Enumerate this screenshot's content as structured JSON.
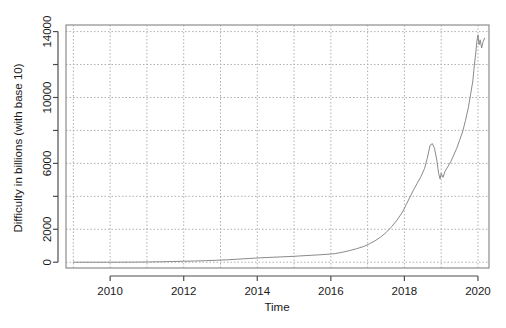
{
  "chart_data": {
    "type": "line",
    "title": "",
    "xlabel": "Time",
    "ylabel": "Difficulty in billions (with base 10)",
    "xlim": [
      2008.8,
      2020.3
    ],
    "ylim": [
      -350,
      14400
    ],
    "xticks": [
      2010,
      2012,
      2014,
      2016,
      2018,
      2020
    ],
    "xtick_labels": [
      "2010",
      "2012",
      "2014",
      "2016",
      "2018",
      "2020"
    ],
    "yticks": [
      0,
      2000,
      4000,
      6000,
      8000,
      10000,
      12000,
      14000
    ],
    "ytick_labels": [
      "0",
      "2000",
      "",
      "6000",
      "",
      "10000",
      "",
      "14000"
    ],
    "grid": true,
    "grid_style": "dotted",
    "grid_color": "#b0b0b0",
    "line_color": "#8a8a8a",
    "line_width": 1,
    "legend": "none",
    "series": [
      {
        "name": "Difficulty",
        "x": [
          2009.0,
          2009.3,
          2009.6,
          2009.9,
          2010.2,
          2010.5,
          2010.8,
          2011.1,
          2011.4,
          2011.7,
          2012.0,
          2012.3,
          2012.6,
          2012.9,
          2013.2,
          2013.5,
          2013.8,
          2014.1,
          2014.4,
          2014.7,
          2015.0,
          2015.3,
          2015.6,
          2015.9,
          2016.1,
          2016.3,
          2016.5,
          2016.7,
          2016.9,
          2017.05,
          2017.2,
          2017.35,
          2017.5,
          2017.65,
          2017.8,
          2017.95,
          2018.05,
          2018.15,
          2018.25,
          2018.35,
          2018.45,
          2018.55,
          2018.62,
          2018.7,
          2018.76,
          2018.82,
          2018.88,
          2018.93,
          2018.97,
          2019.0,
          2019.05,
          2019.1,
          2019.18,
          2019.26,
          2019.34,
          2019.42,
          2019.5,
          2019.58,
          2019.66,
          2019.74,
          2019.8,
          2019.86,
          2019.9,
          2019.94,
          2019.97,
          2020.0,
          2020.03,
          2020.06,
          2020.1,
          2020.14,
          2020.18
        ],
        "y": [
          0,
          0,
          0,
          1,
          2,
          5,
          10,
          18,
          30,
          45,
          60,
          75,
          95,
          120,
          150,
          190,
          230,
          270,
          300,
          330,
          360,
          400,
          440,
          480,
          520,
          600,
          700,
          820,
          960,
          1120,
          1300,
          1520,
          1800,
          2150,
          2560,
          3050,
          3500,
          3950,
          4400,
          4800,
          5200,
          5700,
          6300,
          7100,
          7200,
          6900,
          6200,
          5400,
          5050,
          5400,
          5150,
          5500,
          5800,
          6100,
          6500,
          6900,
          7400,
          7900,
          8600,
          9400,
          10200,
          11000,
          11900,
          12700,
          13400,
          13800,
          13200,
          13500,
          13000,
          13400,
          13600
        ]
      }
    ]
  },
  "plot_geometry": {
    "left": 66,
    "right": 489,
    "top": 25,
    "bottom": 268
  },
  "axis_labels": {
    "x_title": "Time",
    "y_title": "Difficulty in billions (with base 10)"
  }
}
